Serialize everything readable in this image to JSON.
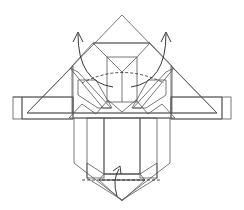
{
  "diagram": {
    "type": "origami-fold-step",
    "colors": {
      "background": "#ffffff",
      "paper_light": "#e2e2e2",
      "paper_mid": "#cfcfcf",
      "paper_dark": "#b9b9b9",
      "paper_white": "#ffffff",
      "line": "#555555",
      "arrow": "#222222"
    },
    "annotations": [
      {
        "name": "valley-fold-line-top",
        "style": "dashed"
      },
      {
        "name": "fold-arrow-left-up",
        "direction": "up"
      },
      {
        "name": "fold-arrow-right-up",
        "direction": "up"
      },
      {
        "name": "valley-fold-line-bottom",
        "style": "dashed"
      },
      {
        "name": "fold-arrow-bottom-up",
        "direction": "up"
      }
    ]
  }
}
